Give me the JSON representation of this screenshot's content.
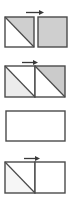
{
  "canvas": {
    "width": 70,
    "height": 200,
    "background": "#ffffff",
    "description": "Four stacked geometric tile diagrams, each a rectangle outlined in dark gray, some divided by a diagonal line into shaded and unshaded triangles, most captioned above by a small right-pointing arrow."
  },
  "palette": {
    "stroke": "#4a4a4a",
    "stroke_light": "#9a9a9a",
    "fill_white": "#ffffff",
    "fill_light_gray": "#e9e9e9",
    "fill_mid_gray": "#d0d0d0",
    "fill_dark_gray": "#c4c4c4",
    "arrow_color": "#3a3a3a",
    "page_background": "#ffffff"
  },
  "panels": [
    {
      "id": "panel-1",
      "name": "two-squares-row",
      "arrow": {
        "present": true,
        "direction": "right",
        "x": 26,
        "y": 9,
        "length": 18
      },
      "x": 4,
      "y": 16,
      "width": 62,
      "height": 30,
      "cells": [
        {
          "index": 0,
          "name": "square-diagonal-upper-shaded",
          "x": 0,
          "y": 0,
          "width": 29,
          "height": 30,
          "fill": "#ffffff",
          "diagonal": "tl-br",
          "shaded_triangle": "upper-right",
          "shade_fill": "#cfcfcf"
        },
        {
          "index": 1,
          "name": "square-solid-gray",
          "x": 33,
          "y": 0,
          "width": 29,
          "height": 30,
          "fill": "#cfcfcf",
          "diagonal": "none",
          "shaded_triangle": "none",
          "shade_fill": "#cfcfcf"
        }
      ]
    },
    {
      "id": "panel-2",
      "name": "split-rect-two-diagonals",
      "arrow": {
        "present": true,
        "direction": "right",
        "x": 22,
        "y": 59,
        "length": 16
      },
      "x": 4,
      "y": 65,
      "width": 60,
      "height": 31,
      "cells": [
        {
          "index": 0,
          "name": "cell-diagonal-lower-shaded",
          "x": 0,
          "y": 0,
          "width": 30,
          "height": 31,
          "fill": "#ffffff",
          "diagonal": "tl-br",
          "shaded_triangle": "lower-left",
          "shade_fill": "#ececec"
        },
        {
          "index": 1,
          "name": "cell-diagonal-upper-shaded",
          "x": 30,
          "y": 0,
          "width": 30,
          "height": 31,
          "fill": "#ffffff",
          "diagonal": "tl-br",
          "shaded_triangle": "upper-right",
          "shade_fill": "#cbcbcb"
        }
      ]
    },
    {
      "id": "panel-3",
      "name": "empty-rect",
      "arrow": {
        "present": false,
        "direction": "right",
        "x": 0,
        "y": 0,
        "length": 0
      },
      "x": 5,
      "y": 110,
      "width": 59,
      "height": 30,
      "cells": [
        {
          "index": 0,
          "name": "cell-blank",
          "x": 0,
          "y": 0,
          "width": 59,
          "height": 30,
          "fill": "#ffffff",
          "diagonal": "none",
          "shaded_triangle": "none",
          "shade_fill": "#ffffff"
        }
      ]
    },
    {
      "id": "panel-4",
      "name": "split-rect-single-diagonal",
      "arrow": {
        "present": true,
        "direction": "right",
        "x": 24,
        "y": 155,
        "length": 16
      },
      "x": 4,
      "y": 161,
      "width": 60,
      "height": 31,
      "cells": [
        {
          "index": 0,
          "name": "cell-diagonal-faint",
          "x": 0,
          "y": 0,
          "width": 30,
          "height": 31,
          "fill": "#ffffff",
          "diagonal": "tl-br",
          "shaded_triangle": "lower-left",
          "shade_fill": "#f6f6f6"
        },
        {
          "index": 1,
          "name": "cell-blank",
          "x": 30,
          "y": 0,
          "width": 30,
          "height": 31,
          "fill": "#ffffff",
          "diagonal": "none",
          "shaded_triangle": "none",
          "shade_fill": "#ffffff"
        }
      ]
    }
  ]
}
